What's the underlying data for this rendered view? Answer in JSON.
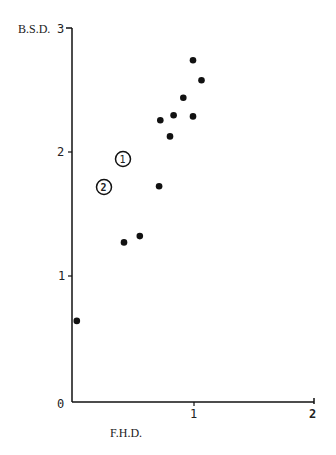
{
  "chart_data": {
    "type": "scatter",
    "title": "",
    "xlabel": "F.H.D.",
    "ylabel": "B.S.D.",
    "xlim": [
      0,
      2
    ],
    "ylim": [
      0,
      3
    ],
    "x_ticks": [
      "0",
      "1",
      "2"
    ],
    "y_ticks": [
      "1",
      "2",
      "3"
    ],
    "grid": false,
    "legend": null,
    "series": [
      {
        "name": "points",
        "points": [
          {
            "x": 0.04,
            "y": 0.65
          },
          {
            "x": 0.43,
            "y": 1.28
          },
          {
            "x": 0.56,
            "y": 1.33
          },
          {
            "x": 0.72,
            "y": 1.73
          },
          {
            "x": 0.73,
            "y": 2.26
          },
          {
            "x": 0.81,
            "y": 2.13
          },
          {
            "x": 0.84,
            "y": 2.3
          },
          {
            "x": 0.92,
            "y": 2.44
          },
          {
            "x": 1.0,
            "y": 2.29
          },
          {
            "x": 1.0,
            "y": 2.74
          },
          {
            "x": 1.07,
            "y": 2.58
          }
        ]
      }
    ],
    "annotations": [
      {
        "label": "1",
        "x": 0.42,
        "y": 1.95,
        "style": "circled"
      },
      {
        "label": "2",
        "x": 0.26,
        "y": 1.72,
        "style": "circled"
      }
    ]
  },
  "axes": {
    "x_label": "F.H.D.",
    "y_label": "B.S.D.",
    "origin_label": "0",
    "x_tick_1": "1",
    "x_tick_2": "2",
    "y_tick_1": "1",
    "y_tick_2": "2",
    "y_tick_3": "3"
  },
  "annotations": {
    "a1": "1",
    "a2": "2"
  }
}
